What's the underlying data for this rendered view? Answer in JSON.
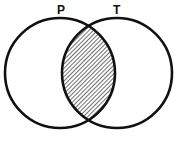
{
  "diagram": {
    "type": "venn",
    "sets": [
      {
        "label": "P",
        "cx": 60,
        "cy": 73,
        "r": 55
      },
      {
        "label": "T",
        "cx": 117,
        "cy": 73,
        "r": 55
      }
    ],
    "shaded_region": "P ∩ T",
    "shading": "diagonal-hatch",
    "colors": {
      "stroke": "#111111",
      "hatch": "#222222",
      "background": "#ffffff"
    }
  }
}
